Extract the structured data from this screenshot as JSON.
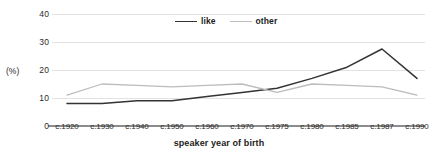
{
  "chart_data": {
    "type": "line",
    "title": "",
    "subtitle": "",
    "xlabel": "speaker year of birth",
    "ylabel": "(%)",
    "categories": [
      "c.1920",
      "c.1930",
      "c.1940",
      "c.1950",
      "c.1960",
      "c.1970",
      "c.1975",
      "c.1980",
      "c.1985",
      "c.1987",
      "c.1990"
    ],
    "series": [
      {
        "name": "like",
        "color": "#333333",
        "values": [
          8,
          8,
          9,
          9,
          10.5,
          12,
          13.5,
          17,
          21,
          27.5,
          17
        ]
      },
      {
        "name": "other",
        "color": "#bcbcbc",
        "values": [
          11,
          15,
          14.5,
          14,
          14.5,
          15,
          12,
          15,
          14.5,
          14,
          11
        ]
      }
    ],
    "ylim": [
      0,
      40
    ],
    "yticks": [
      0,
      10,
      20,
      30,
      40
    ],
    "ytick_labels": [
      "0",
      "10",
      "20",
      "30",
      "40"
    ],
    "grid": "horizontal",
    "legend_position": "top-center",
    "annotations": []
  },
  "colors": {
    "grid": "#e2e2e2",
    "axis": "#8c8c8c",
    "text": "#2b2b2b",
    "background": "#ffffff"
  }
}
